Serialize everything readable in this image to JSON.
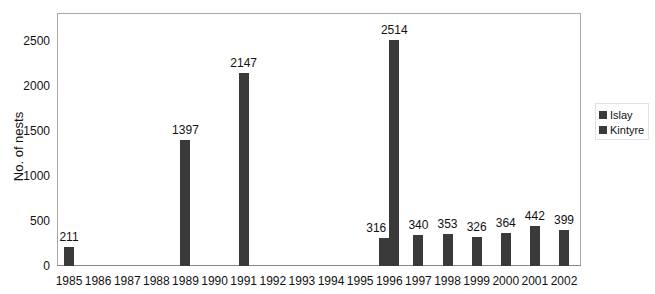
{
  "chart_data": {
    "type": "bar",
    "title": "",
    "xlabel": "",
    "ylabel": "No. of nests",
    "ylim": [
      0,
      2800
    ],
    "yticks": [
      0,
      500,
      1000,
      1500,
      2000,
      2500
    ],
    "grid": false,
    "legend_position": "right",
    "categories": [
      "1985",
      "1986",
      "1987",
      "1988",
      "1989",
      "1990",
      "1991",
      "1992",
      "1993",
      "1994",
      "1995",
      "1996",
      "1997",
      "1998",
      "1999",
      "2000",
      "2001",
      "2002"
    ],
    "series": [
      {
        "name": "Islay",
        "color": "#3a3a3a",
        "values": [
          null,
          null,
          null,
          null,
          null,
          null,
          null,
          null,
          null,
          null,
          null,
          316,
          340,
          353,
          326,
          364,
          442,
          399
        ]
      },
      {
        "name": "Kintyre",
        "color": "#3a3a3a",
        "values": [
          211,
          null,
          null,
          null,
          1397,
          null,
          2147,
          null,
          null,
          null,
          null,
          2514,
          null,
          null,
          null,
          null,
          null,
          null
        ]
      }
    ],
    "data_labels": [
      {
        "year": "1985",
        "series": "Kintyre",
        "text": "211"
      },
      {
        "year": "1989",
        "series": "Kintyre",
        "text": "1397"
      },
      {
        "year": "1991",
        "series": "Kintyre",
        "text": "2147"
      },
      {
        "year": "1996",
        "series": "Islay",
        "text": "316"
      },
      {
        "year": "1996",
        "series": "Kintyre",
        "text": "2514"
      },
      {
        "year": "1997",
        "series": "Islay",
        "text": "340"
      },
      {
        "year": "1998",
        "series": "Islay",
        "text": "353"
      },
      {
        "year": "1999",
        "series": "Islay",
        "text": "326"
      },
      {
        "year": "2000",
        "series": "Islay",
        "text": "364"
      },
      {
        "year": "2001",
        "series": "Islay",
        "text": "442"
      },
      {
        "year": "2002",
        "series": "Islay",
        "text": "399"
      }
    ]
  },
  "legend": {
    "items": [
      {
        "label": "Islay"
      },
      {
        "label": "Kintyre"
      }
    ]
  }
}
